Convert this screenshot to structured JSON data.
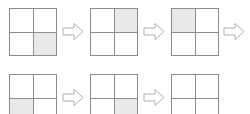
{
  "figure": {
    "width": 250,
    "height": 114,
    "background_color": "#ffffff"
  },
  "style": {
    "grid_border_color": "#8c8c8c",
    "grid_divider_color": "#8c8c8c",
    "grid_fill_color": "#ffffff",
    "shaded_cell_color": "#e9e9e9",
    "arrow_outline_color": "#b0b0b0",
    "arrow_fill_color": "#ffffff"
  },
  "rows": [
    {
      "name": "sequence-row-1",
      "top": 8,
      "items": [
        {
          "kind": "grid",
          "name": "grid-step-1",
          "label": "Step 1",
          "left": 9,
          "size": 48,
          "cells": [
            {
              "name": "cell-top-left",
              "position": "tl",
              "shaded": false
            },
            {
              "name": "cell-top-right",
              "position": "tr",
              "shaded": false
            },
            {
              "name": "cell-bottom-left",
              "position": "bl",
              "shaded": false
            },
            {
              "name": "cell-bottom-right",
              "position": "br",
              "shaded": true
            }
          ]
        },
        {
          "kind": "arrow",
          "name": "arrow-step-1-to-2",
          "label": "leads to",
          "left": 62,
          "top_offset": 14,
          "width": 22,
          "height": 19
        },
        {
          "kind": "grid",
          "name": "grid-step-2",
          "label": "Step 2",
          "left": 90,
          "size": 48,
          "cells": [
            {
              "name": "cell-top-left",
              "position": "tl",
              "shaded": false
            },
            {
              "name": "cell-top-right",
              "position": "tr",
              "shaded": true
            },
            {
              "name": "cell-bottom-left",
              "position": "bl",
              "shaded": false
            },
            {
              "name": "cell-bottom-right",
              "position": "br",
              "shaded": false
            }
          ]
        },
        {
          "kind": "arrow",
          "name": "arrow-step-2-to-3",
          "label": "leads to",
          "left": 143,
          "top_offset": 14,
          "width": 22,
          "height": 19
        },
        {
          "kind": "grid",
          "name": "grid-step-3",
          "label": "Step 3",
          "left": 171,
          "size": 48,
          "cells": [
            {
              "name": "cell-top-left",
              "position": "tl",
              "shaded": true
            },
            {
              "name": "cell-top-right",
              "position": "tr",
              "shaded": false
            },
            {
              "name": "cell-bottom-left",
              "position": "bl",
              "shaded": false
            },
            {
              "name": "cell-bottom-right",
              "position": "br",
              "shaded": false
            }
          ]
        },
        {
          "kind": "arrow",
          "name": "arrow-step-3-to-4",
          "label": "leads to",
          "left": 223,
          "top_offset": 14,
          "width": 22,
          "height": 19
        }
      ]
    },
    {
      "name": "sequence-row-2",
      "top": 74,
      "items": [
        {
          "kind": "grid",
          "name": "grid-step-4",
          "label": "Step 4",
          "left": 9,
          "size": 48,
          "cells": [
            {
              "name": "cell-top-left",
              "position": "tl",
              "shaded": false
            },
            {
              "name": "cell-top-right",
              "position": "tr",
              "shaded": false
            },
            {
              "name": "cell-bottom-left",
              "position": "bl",
              "shaded": true
            },
            {
              "name": "cell-bottom-right",
              "position": "br",
              "shaded": false
            }
          ]
        },
        {
          "kind": "arrow",
          "name": "arrow-step-4-to-5",
          "label": "leads to",
          "left": 62,
          "top_offset": 14,
          "width": 22,
          "height": 19
        },
        {
          "kind": "grid",
          "name": "grid-step-5",
          "label": "Step 5",
          "left": 90,
          "size": 48,
          "cells": [
            {
              "name": "cell-top-left",
              "position": "tl",
              "shaded": false
            },
            {
              "name": "cell-top-right",
              "position": "tr",
              "shaded": false
            },
            {
              "name": "cell-bottom-left",
              "position": "bl",
              "shaded": false
            },
            {
              "name": "cell-bottom-right",
              "position": "br",
              "shaded": true
            }
          ]
        },
        {
          "kind": "arrow",
          "name": "arrow-step-5-to-6",
          "label": "leads to",
          "left": 143,
          "top_offset": 14,
          "width": 22,
          "height": 19
        },
        {
          "kind": "grid",
          "name": "grid-step-6",
          "label": "Step 6",
          "left": 171,
          "size": 48,
          "cells": [
            {
              "name": "cell-top-left",
              "position": "tl",
              "shaded": false
            },
            {
              "name": "cell-top-right",
              "position": "tr",
              "shaded": false
            },
            {
              "name": "cell-bottom-left",
              "position": "bl",
              "shaded": false
            },
            {
              "name": "cell-bottom-right",
              "position": "br",
              "shaded": false
            }
          ]
        }
      ]
    }
  ]
}
